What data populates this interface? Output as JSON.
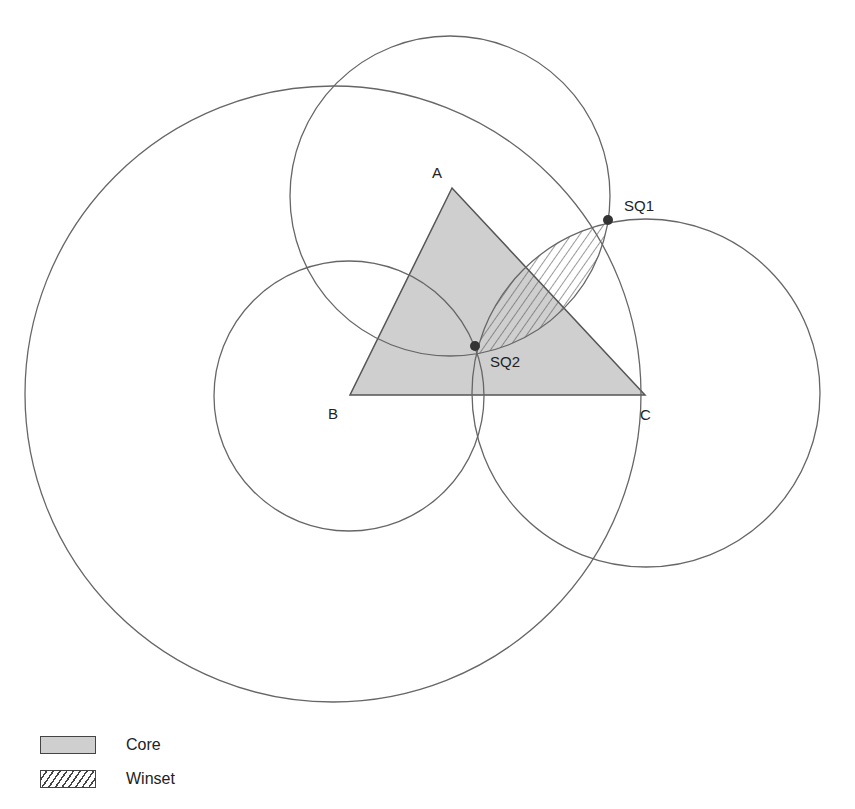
{
  "diagram": {
    "points": [
      {
        "id": "A",
        "label": "A",
        "x": 452,
        "y": 188,
        "label_x": 432,
        "label_y": 178
      },
      {
        "id": "B",
        "label": "B",
        "x": 350,
        "y": 395,
        "label_x": 328,
        "label_y": 419
      },
      {
        "id": "C",
        "label": "C",
        "x": 645,
        "y": 395,
        "label_x": 640,
        "label_y": 420
      }
    ],
    "status_quo_points": [
      {
        "id": "SQ1",
        "label": "SQ1",
        "x": 608,
        "y": 220,
        "label_x": 624,
        "label_y": 211
      },
      {
        "id": "SQ2",
        "label": "SQ2",
        "x": 475,
        "y": 346,
        "label_x": 490,
        "label_y": 367
      }
    ],
    "circles": [
      {
        "name": "indifference-circle-a-sq2",
        "cx": 450,
        "cy": 196,
        "r": 160
      },
      {
        "name": "indifference-circle-b-sq2",
        "cx": 349,
        "cy": 396,
        "r": 135
      },
      {
        "name": "indifference-circle-c",
        "cx": 646,
        "cy": 393,
        "r": 174
      },
      {
        "name": "indifference-circle-b-sq1",
        "cx": 333,
        "cy": 394,
        "r": 308
      }
    ],
    "colors": {
      "core_fill": "#cfcfcf",
      "stroke": "#555555",
      "hatch": "#555555"
    }
  },
  "legend": {
    "items": [
      {
        "label": "Core",
        "pattern": "solid-gray"
      },
      {
        "label": "Winset",
        "pattern": "hatched"
      }
    ]
  }
}
